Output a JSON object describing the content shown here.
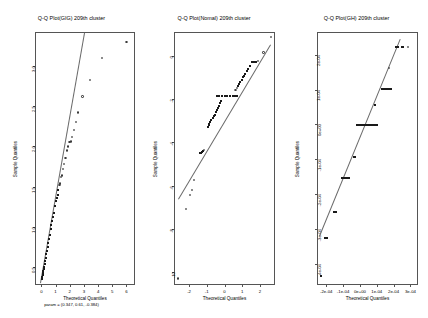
{
  "figure": {
    "background": "#ffffff",
    "line_color": "#6a6a6a",
    "point_color": "#1a1a1a",
    "axis_color": "#555555",
    "panel_count": 3
  },
  "chart_data": [
    {
      "type": "scatter",
      "title": "Q-Q Plot(GIG) 209th cluster",
      "subtitle": "param = (0.347, 0.61, -0.384)",
      "xlabel": "Theoretical Quantiles",
      "ylabel": "Sample Quantiles",
      "grid": false,
      "legend": "none",
      "xlim": [
        -0.45,
        6.6
      ],
      "ylim": [
        0.28,
        3.42
      ],
      "xticks": [
        0,
        1,
        2,
        3,
        4,
        5,
        6
      ],
      "xticklabels": [
        "0",
        "1",
        "2",
        "3",
        "4",
        "5",
        "6"
      ],
      "yticks": [
        0.5,
        1.0,
        1.5,
        2.0,
        2.5,
        3.0
      ],
      "yticklabels": [
        "0.5",
        "1.0",
        "1.5",
        "2.0",
        "2.5",
        "3.0"
      ],
      "reference_line": {
        "x0": -0.1,
        "y0": 0.3,
        "x1": 3.0,
        "y1": 3.4
      },
      "points": [
        {
          "x": 0.02,
          "y": 0.36,
          "marker": "filled"
        },
        {
          "x": 0.05,
          "y": 0.38,
          "marker": "filled"
        },
        {
          "x": 0.08,
          "y": 0.4,
          "marker": "filled"
        },
        {
          "x": 0.1,
          "y": 0.43,
          "marker": "filled"
        },
        {
          "x": 0.13,
          "y": 0.45,
          "marker": "filled"
        },
        {
          "x": 0.16,
          "y": 0.48,
          "marker": "filled"
        },
        {
          "x": 0.19,
          "y": 0.5,
          "marker": "filled"
        },
        {
          "x": 0.22,
          "y": 0.54,
          "marker": "filled"
        },
        {
          "x": 0.26,
          "y": 0.58,
          "marker": "filled"
        },
        {
          "x": 0.3,
          "y": 0.62,
          "marker": "filled"
        },
        {
          "x": 0.34,
          "y": 0.66,
          "marker": "filled"
        },
        {
          "x": 0.38,
          "y": 0.7,
          "marker": "filled"
        },
        {
          "x": 0.43,
          "y": 0.75,
          "marker": "filled"
        },
        {
          "x": 0.48,
          "y": 0.8,
          "marker": "filled"
        },
        {
          "x": 0.53,
          "y": 0.85,
          "marker": "filled"
        },
        {
          "x": 0.58,
          "y": 0.9,
          "marker": "filled"
        },
        {
          "x": 0.64,
          "y": 0.97,
          "marker": "filled"
        },
        {
          "x": 0.7,
          "y": 1.02,
          "marker": "filled"
        },
        {
          "x": 0.76,
          "y": 1.08,
          "marker": "filled"
        },
        {
          "x": 0.82,
          "y": 1.12,
          "marker": "filled"
        },
        {
          "x": 0.88,
          "y": 1.18,
          "marker": "filled"
        },
        {
          "x": 0.95,
          "y": 1.26,
          "marker": "filled"
        },
        {
          "x": 1.02,
          "y": 1.32,
          "marker": "filled"
        },
        {
          "x": 1.08,
          "y": 1.36,
          "marker": "filled"
        },
        {
          "x": 1.14,
          "y": 1.4,
          "marker": "filled"
        },
        {
          "x": 1.2,
          "y": 1.46,
          "marker": "filled"
        },
        {
          "x": 1.28,
          "y": 1.52,
          "marker": "open"
        },
        {
          "x": 1.33,
          "y": 1.54,
          "marker": "open"
        },
        {
          "x": 1.4,
          "y": 1.62,
          "marker": "open"
        },
        {
          "x": 1.45,
          "y": 1.64,
          "marker": "open"
        },
        {
          "x": 1.52,
          "y": 1.72,
          "marker": "open"
        },
        {
          "x": 1.6,
          "y": 1.78,
          "marker": "open"
        },
        {
          "x": 1.7,
          "y": 1.86,
          "marker": "open"
        },
        {
          "x": 1.8,
          "y": 1.95,
          "marker": "open"
        },
        {
          "x": 1.9,
          "y": 2.0,
          "marker": "open"
        },
        {
          "x": 1.98,
          "y": 2.05,
          "marker": "open"
        },
        {
          "x": 2.06,
          "y": 2.06,
          "marker": "open"
        },
        {
          "x": 2.14,
          "y": 2.12,
          "marker": "open"
        },
        {
          "x": 2.3,
          "y": 2.2,
          "marker": "open"
        },
        {
          "x": 2.45,
          "y": 2.3,
          "marker": "open"
        },
        {
          "x": 2.6,
          "y": 2.42,
          "marker": "open"
        },
        {
          "x": 2.9,
          "y": 2.62,
          "marker": "open"
        },
        {
          "x": 3.4,
          "y": 2.82,
          "marker": "open"
        },
        {
          "x": 4.25,
          "y": 3.1,
          "marker": "open"
        },
        {
          "x": 6.0,
          "y": 3.3,
          "marker": "open"
        }
      ]
    },
    {
      "type": "scatter",
      "title": "Q-Q Plot(Nomal) 209th cluster",
      "subtitle": "",
      "xlabel": "Theoretical Quantiles",
      "ylabel": "Sample Quantiles",
      "grid": false,
      "legend": "none",
      "xlim": [
        -2.85,
        2.85
      ],
      "ylim": [
        -10.6,
        1.1
      ],
      "xticks": [
        -2,
        -1,
        0,
        1,
        2
      ],
      "xticklabels": [
        "-2",
        "-1",
        "0",
        "1",
        "2"
      ],
      "yticks": [
        -10,
        -8,
        -6,
        -4,
        -2,
        0
      ],
      "yticklabels": [
        "-10",
        "-8",
        "-6",
        "-4",
        "-2",
        "0"
      ],
      "reference_line": {
        "x0": -2.6,
        "y0": -6.6,
        "x1": 2.6,
        "y1": 0.55
      },
      "points": [
        {
          "x": -2.62,
          "y": -10.3,
          "marker": "open"
        },
        {
          "x": -2.18,
          "y": -7.1,
          "marker": "open"
        },
        {
          "x": -1.95,
          "y": -6.45,
          "marker": "open"
        },
        {
          "x": -1.82,
          "y": -6.2,
          "marker": "open"
        },
        {
          "x": -1.7,
          "y": -5.75,
          "marker": "open"
        },
        {
          "x": -1.4,
          "y": -4.5,
          "marker": "filled"
        },
        {
          "x": -1.34,
          "y": -4.48,
          "marker": "filled"
        },
        {
          "x": -1.28,
          "y": -4.44,
          "marker": "filled"
        },
        {
          "x": -1.22,
          "y": -4.4,
          "marker": "filled"
        },
        {
          "x": -1.15,
          "y": -4.36,
          "marker": "open"
        },
        {
          "x": -0.95,
          "y": -3.3,
          "marker": "filled"
        },
        {
          "x": -0.9,
          "y": -3.22,
          "marker": "filled"
        },
        {
          "x": -0.85,
          "y": -3.15,
          "marker": "filled"
        },
        {
          "x": -0.8,
          "y": -3.05,
          "marker": "filled"
        },
        {
          "x": -0.74,
          "y": -2.95,
          "marker": "filled"
        },
        {
          "x": -0.68,
          "y": -2.88,
          "marker": "filled"
        },
        {
          "x": -0.62,
          "y": -2.8,
          "marker": "filled"
        },
        {
          "x": -0.56,
          "y": -2.72,
          "marker": "filled"
        },
        {
          "x": -0.5,
          "y": -2.6,
          "marker": "filled"
        },
        {
          "x": -0.44,
          "y": -2.5,
          "marker": "filled"
        },
        {
          "x": -0.38,
          "y": -2.42,
          "marker": "filled"
        },
        {
          "x": -0.32,
          "y": -2.3,
          "marker": "filled"
        },
        {
          "x": -0.26,
          "y": -2.2,
          "marker": "filled"
        },
        {
          "x": -0.2,
          "y": -2.1,
          "marker": "filled"
        },
        {
          "x": -0.45,
          "y": -1.85,
          "marker": "filled"
        },
        {
          "x": -0.3,
          "y": -1.85,
          "marker": "filled"
        },
        {
          "x": -0.15,
          "y": -1.85,
          "marker": "filled"
        },
        {
          "x": 0.0,
          "y": -1.85,
          "marker": "filled"
        },
        {
          "x": 0.15,
          "y": -1.85,
          "marker": "filled"
        },
        {
          "x": 0.3,
          "y": -1.85,
          "marker": "filled"
        },
        {
          "x": 0.45,
          "y": -1.85,
          "marker": "filled"
        },
        {
          "x": 0.6,
          "y": -1.85,
          "marker": "filled"
        },
        {
          "x": 0.72,
          "y": -1.85,
          "marker": "filled"
        },
        {
          "x": 0.62,
          "y": -1.6,
          "marker": "open"
        },
        {
          "x": 0.7,
          "y": -1.5,
          "marker": "open"
        },
        {
          "x": 0.78,
          "y": -1.38,
          "marker": "filled"
        },
        {
          "x": 0.84,
          "y": -1.3,
          "marker": "filled"
        },
        {
          "x": 0.9,
          "y": -1.2,
          "marker": "filled"
        },
        {
          "x": 0.96,
          "y": -1.12,
          "marker": "filled"
        },
        {
          "x": 1.02,
          "y": -1.0,
          "marker": "filled"
        },
        {
          "x": 1.1,
          "y": -0.92,
          "marker": "filled"
        },
        {
          "x": 1.18,
          "y": -0.82,
          "marker": "filled"
        },
        {
          "x": 1.26,
          "y": -0.72,
          "marker": "filled"
        },
        {
          "x": 1.34,
          "y": -0.62,
          "marker": "filled"
        },
        {
          "x": 1.45,
          "y": -0.45,
          "marker": "filled"
        },
        {
          "x": 1.55,
          "y": -0.3,
          "marker": "filled"
        },
        {
          "x": 1.62,
          "y": -0.3,
          "marker": "filled"
        },
        {
          "x": 1.7,
          "y": -0.3,
          "marker": "filled"
        },
        {
          "x": 1.78,
          "y": -0.3,
          "marker": "filled"
        },
        {
          "x": 1.9,
          "y": -0.25,
          "marker": "open"
        },
        {
          "x": 2.2,
          "y": 0.15,
          "marker": "open"
        },
        {
          "x": 2.62,
          "y": 0.85,
          "marker": "open"
        }
      ]
    },
    {
      "type": "scatter",
      "title": "Q-Q Plot(GH) 209th cluster",
      "subtitle": "",
      "xlabel": "Theoretical Quantiles",
      "ylabel": "Sample Quantiles",
      "grid": false,
      "legend": "none",
      "xlim": [
        -0.000255,
        0.000345
      ],
      "ylim": [
        -0.00046,
        0.000265
      ],
      "xticks": [
        -0.0002,
        -0.0001,
        0,
        0.0001,
        0.0002,
        0.0003
      ],
      "xticklabels": [
        "-2e-04",
        "-1e-04",
        "0e+00",
        "1e-04",
        "2e-04",
        "3e-04"
      ],
      "yticks": [
        -0.0004,
        -0.0003,
        -0.0002,
        -0.0001,
        0,
        0.0001,
        0.0002
      ],
      "yticklabels": [
        "-4e-04",
        "-3e-04",
        "-2e-04",
        "-1e-04",
        "0e+00",
        "1e-04",
        "2e-04"
      ],
      "reference_line": {
        "x0": -0.000245,
        "y0": -0.00032,
        "x1": 0.000235,
        "y1": 0.000245
      },
      "points": [
        {
          "x": -0.000232,
          "y": -0.000435,
          "marker": "filled"
        },
        {
          "x": -0.000205,
          "y": -0.000325,
          "marker": "filled"
        },
        {
          "x": -0.000198,
          "y": -0.000325,
          "marker": "filled"
        },
        {
          "x": -0.000152,
          "y": -0.000252,
          "marker": "filled"
        },
        {
          "x": -0.000145,
          "y": -0.000252,
          "marker": "filled"
        },
        {
          "x": -0.000108,
          "y": -0.000152,
          "marker": "filled"
        },
        {
          "x": -0.0001,
          "y": -0.000152,
          "marker": "filled"
        },
        {
          "x": -9.2e-05,
          "y": -0.000152,
          "marker": "filled"
        },
        {
          "x": -8.2e-05,
          "y": -0.000152,
          "marker": "filled"
        },
        {
          "x": -7.4e-05,
          "y": -0.000152,
          "marker": "filled"
        },
        {
          "x": -6.6e-05,
          "y": -0.000152,
          "marker": "filled"
        },
        {
          "x": -3.8e-05,
          "y": -9.2e-05,
          "marker": "filled"
        },
        {
          "x": -3e-05,
          "y": -9.2e-05,
          "marker": "filled"
        },
        {
          "x": -2e-05,
          "y": 0,
          "marker": "filled"
        },
        {
          "x": -1e-05,
          "y": 0,
          "marker": "filled"
        },
        {
          "x": 0,
          "y": 0,
          "marker": "filled"
        },
        {
          "x": 1e-05,
          "y": 0,
          "marker": "filled"
        },
        {
          "x": 2e-05,
          "y": 0,
          "marker": "filled"
        },
        {
          "x": 3e-05,
          "y": 0,
          "marker": "filled"
        },
        {
          "x": 4e-05,
          "y": 0,
          "marker": "filled"
        },
        {
          "x": 5e-05,
          "y": 0,
          "marker": "filled"
        },
        {
          "x": 6e-05,
          "y": 0,
          "marker": "filled"
        },
        {
          "x": 7e-05,
          "y": 0,
          "marker": "filled"
        },
        {
          "x": 8e-05,
          "y": 0,
          "marker": "filled"
        },
        {
          "x": 9e-05,
          "y": 0,
          "marker": "filled"
        },
        {
          "x": 0.0001,
          "y": 0,
          "marker": "filled"
        },
        {
          "x": 9.2e-05,
          "y": 5.5e-05,
          "marker": "filled"
        },
        {
          "x": 0.000132,
          "y": 0.000102,
          "marker": "filled"
        },
        {
          "x": 0.000142,
          "y": 0.000102,
          "marker": "filled"
        },
        {
          "x": 0.000152,
          "y": 0.000102,
          "marker": "filled"
        },
        {
          "x": 0.000162,
          "y": 0.000102,
          "marker": "filled"
        },
        {
          "x": 0.000172,
          "y": 0.000102,
          "marker": "filled"
        },
        {
          "x": 0.000182,
          "y": 0.000102,
          "marker": "filled"
        },
        {
          "x": 0.000175,
          "y": 0.000162,
          "marker": "open"
        },
        {
          "x": 0.000215,
          "y": 0.000222,
          "marker": "filled"
        },
        {
          "x": 0.000225,
          "y": 0.000222,
          "marker": "filled"
        },
        {
          "x": 0.000248,
          "y": 0.000222,
          "marker": "filled"
        },
        {
          "x": 0.000258,
          "y": 0.000222,
          "marker": "filled"
        },
        {
          "x": 0.000288,
          "y": 0.000222,
          "marker": "open"
        }
      ]
    }
  ]
}
